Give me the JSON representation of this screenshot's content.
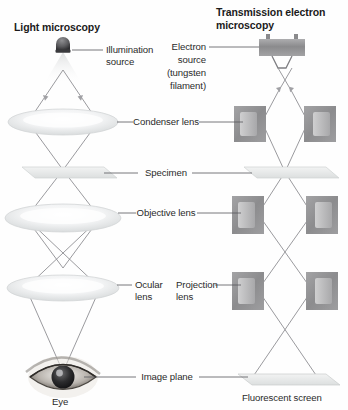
{
  "figure": {
    "title_left": "Light microscopy",
    "title_right_line1": "Transmission electron",
    "title_right_line2": "microscopy"
  },
  "left_column": {
    "name": "light-microscope-column",
    "labels": {
      "illumination_line1": "Illumination",
      "illumination_line2": "source",
      "eye": "Eye"
    },
    "components": [
      {
        "name": "illumination-source",
        "label": "Illumination source"
      },
      {
        "name": "condenser-lens",
        "label": "Condenser lens"
      },
      {
        "name": "specimen-slide",
        "label": "Specimen"
      },
      {
        "name": "objective-lens",
        "label": "Objective lens"
      },
      {
        "name": "ocular-lens",
        "label": "Ocular lens"
      },
      {
        "name": "eye",
        "label": "Eye"
      }
    ]
  },
  "right_column": {
    "name": "transmission-electron-microscope-column",
    "labels": {
      "electron_line1": "Electron",
      "electron_line2": "source",
      "electron_line3": "(tungsten",
      "electron_line4": "filament)",
      "projection_line1": "Projection",
      "projection_line2": "lens",
      "fluorescent_screen": "Fluorescent screen"
    },
    "components": [
      {
        "name": "electron-source",
        "label": "Electron source (tungsten filament)"
      },
      {
        "name": "condenser-lens",
        "label": "Condenser lens"
      },
      {
        "name": "specimen-stage",
        "label": "Specimen"
      },
      {
        "name": "objective-lens",
        "label": "Objective lens"
      },
      {
        "name": "projection-lens",
        "label": "Projection lens"
      },
      {
        "name": "fluorescent-screen",
        "label": "Fluorescent screen"
      }
    ]
  },
  "shared_labels": {
    "condenser_lens": "Condenser lens",
    "specimen": "Specimen",
    "objective_lens": "Objective lens",
    "ocular_line1": "Ocular",
    "ocular_line2": "lens",
    "image_plane": "Image plane"
  },
  "colors": {
    "background": "#fefefe",
    "text": "#1b1b1b",
    "label_text": "#2b2b2b",
    "ray": "#8f8f93",
    "leader": "#55555a",
    "lens_glass": "#e9ebec",
    "magnet_block": "#8e8e90",
    "magnet_inner": "#bdbdbd",
    "slide": "#e4e6e6",
    "screen": "#e8eaea",
    "source_body": "#9a9a9c"
  }
}
